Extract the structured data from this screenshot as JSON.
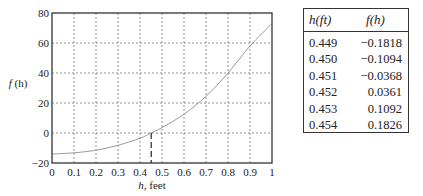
{
  "chart_data": [
    {
      "type": "line",
      "title": "",
      "xlabel": "h, feet",
      "ylabel": "f (h)",
      "xlim": [
        0,
        1
      ],
      "ylim": [
        -20,
        80
      ],
      "grid": true,
      "x_ticks": [
        "0",
        "0.1",
        "0.2",
        "0.3",
        "0.4",
        "0.5",
        "0.6",
        "0.7",
        "0.8",
        "0.9",
        "1"
      ],
      "y_ticks": [
        "-20",
        "0",
        "20",
        "40",
        "60",
        "80"
      ],
      "series": [
        {
          "name": "f(h)",
          "x": [
            0,
            0.1,
            0.2,
            0.3,
            0.4,
            0.45,
            0.5,
            0.6,
            0.7,
            0.8,
            0.9,
            1.0
          ],
          "y": [
            -14,
            -13.2,
            -11.5,
            -8.2,
            -3.5,
            0,
            3.6,
            12.5,
            24.5,
            40,
            58,
            73
          ]
        }
      ],
      "annotations": [
        {
          "type": "dashed-vertical",
          "x": 0.451,
          "from_y": -20,
          "to_y": 0
        }
      ]
    },
    {
      "type": "table",
      "columns": [
        "h(ft)",
        "f(h)"
      ],
      "rows": [
        [
          "0.449",
          "−0.1818"
        ],
        [
          "0.450",
          "−0.1094"
        ],
        [
          "0.451",
          "−0.0368"
        ],
        [
          "0.452",
          "0.0361"
        ],
        [
          "0.453",
          "0.1092"
        ],
        [
          "0.454",
          "0.1826"
        ]
      ]
    }
  ],
  "axes": {
    "xlabel": "h, feet",
    "ylabel": "f (h)"
  },
  "table": {
    "header": {
      "h": "h(ft)",
      "f": "f(h)"
    },
    "rows": [
      {
        "h": "0.449",
        "f": "−0.1818"
      },
      {
        "h": "0.450",
        "f": "−0.1094"
      },
      {
        "h": "0.451",
        "f": "−0.0368"
      },
      {
        "h": "0.452",
        "f": "0.0361"
      },
      {
        "h": "0.453",
        "f": "0.1092"
      },
      {
        "h": "0.454",
        "f": "0.1826"
      }
    ]
  },
  "colors": {
    "axis": "#333333",
    "grid": "#777777",
    "curve": "#999999"
  }
}
